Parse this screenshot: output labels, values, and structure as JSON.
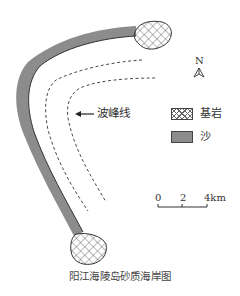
{
  "figure": {
    "caption": "阳江海陵岛砂质海岸图",
    "north_arrow": {
      "label": "N",
      "icon": "north-arrow-icon"
    },
    "annotation": {
      "label": "波峰线",
      "icon": "arrow-left-icon"
    },
    "legend": {
      "items": [
        {
          "label": "基岩",
          "pattern": "crosshatch"
        },
        {
          "label": "沙",
          "pattern": "solid",
          "color": "#8c8c8c"
        }
      ]
    },
    "scale_bar": {
      "ticks": [
        "0",
        "2",
        "4km"
      ]
    },
    "colors": {
      "sand": "#8c8c8c",
      "line": "#333333",
      "background": "#ffffff"
    }
  }
}
